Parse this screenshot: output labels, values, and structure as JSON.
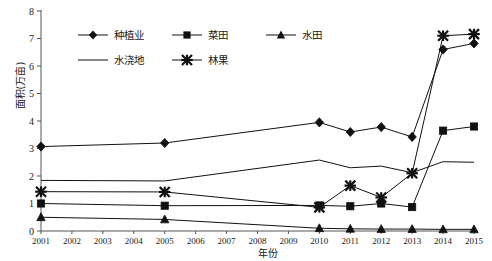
{
  "chart_data": {
    "type": "line",
    "title": "",
    "xlabel": "年份",
    "ylabel": "面积(万亩)",
    "categories": [
      "2001",
      "2002",
      "2003",
      "2004",
      "2005",
      "2006",
      "2007",
      "2008",
      "2009",
      "2010",
      "2011",
      "2012",
      "2013",
      "2014",
      "2015"
    ],
    "x": [
      2001,
      2002,
      2003,
      2004,
      2005,
      2006,
      2007,
      2008,
      2009,
      2010,
      2011,
      2012,
      2013,
      2014,
      2015
    ],
    "xlim": [
      2001,
      2015
    ],
    "ylim": [
      0,
      8
    ],
    "yticks": [
      0,
      1,
      2,
      3,
      4,
      5,
      6,
      7,
      8
    ],
    "grid": false,
    "legend_position": "upper-left-inside",
    "series": [
      {
        "name": "种植业",
        "marker": "diamond",
        "points": [
          {
            "x": 2001,
            "y": 3.07
          },
          {
            "x": 2005,
            "y": 3.2
          },
          {
            "x": 2010,
            "y": 3.95
          },
          {
            "x": 2011,
            "y": 3.6
          },
          {
            "x": 2012,
            "y": 3.78
          },
          {
            "x": 2013,
            "y": 3.42
          },
          {
            "x": 2014,
            "y": 6.6
          },
          {
            "x": 2015,
            "y": 6.82
          }
        ]
      },
      {
        "name": "菜田",
        "marker": "square",
        "points": [
          {
            "x": 2001,
            "y": 1.0
          },
          {
            "x": 2005,
            "y": 0.92
          },
          {
            "x": 2010,
            "y": 0.93
          },
          {
            "x": 2011,
            "y": 0.9
          },
          {
            "x": 2012,
            "y": 1.0
          },
          {
            "x": 2013,
            "y": 0.87
          },
          {
            "x": 2014,
            "y": 3.65
          },
          {
            "x": 2015,
            "y": 3.8
          }
        ]
      },
      {
        "name": "水田",
        "marker": "triangle",
        "points": [
          {
            "x": 2001,
            "y": 0.5
          },
          {
            "x": 2005,
            "y": 0.42
          },
          {
            "x": 2010,
            "y": 0.1
          },
          {
            "x": 2011,
            "y": 0.08
          },
          {
            "x": 2012,
            "y": 0.07
          },
          {
            "x": 2013,
            "y": 0.07
          },
          {
            "x": 2014,
            "y": 0.06
          },
          {
            "x": 2015,
            "y": 0.06
          }
        ]
      },
      {
        "name": "水浇地",
        "marker": "none",
        "points": [
          {
            "x": 2001,
            "y": 1.84
          },
          {
            "x": 2005,
            "y": 1.82
          },
          {
            "x": 2010,
            "y": 2.58
          },
          {
            "x": 2011,
            "y": 2.3
          },
          {
            "x": 2012,
            "y": 2.36
          },
          {
            "x": 2013,
            "y": 2.12
          },
          {
            "x": 2014,
            "y": 2.52
          },
          {
            "x": 2015,
            "y": 2.5
          }
        ]
      },
      {
        "name": "林果",
        "marker": "star",
        "points": [
          {
            "x": 2001,
            "y": 1.43
          },
          {
            "x": 2005,
            "y": 1.42
          },
          {
            "x": 2010,
            "y": 0.86
          },
          {
            "x": 2011,
            "y": 1.65
          },
          {
            "x": 2012,
            "y": 1.22
          },
          {
            "x": 2013,
            "y": 2.1
          },
          {
            "x": 2014,
            "y": 7.1
          },
          {
            "x": 2015,
            "y": 7.16
          }
        ]
      }
    ],
    "legend": [
      {
        "label": "种植业",
        "marker": "diamond"
      },
      {
        "label": "菜田",
        "marker": "square"
      },
      {
        "label": "水田",
        "marker": "triangle"
      },
      {
        "label": "水浇地",
        "marker": "none"
      },
      {
        "label": "林果",
        "marker": "star"
      }
    ]
  }
}
